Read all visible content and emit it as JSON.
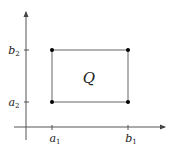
{
  "diagram": {
    "region_label": "Q",
    "x_ticks": [
      {
        "label": "a",
        "sub": "1"
      },
      {
        "label": "b",
        "sub": "1"
      }
    ],
    "y_ticks": [
      {
        "label": "b",
        "sub": "2"
      },
      {
        "label": "a",
        "sub": "2"
      }
    ],
    "colors": {
      "axis": "#555555",
      "rect": "#666666",
      "point": "#000000"
    }
  }
}
